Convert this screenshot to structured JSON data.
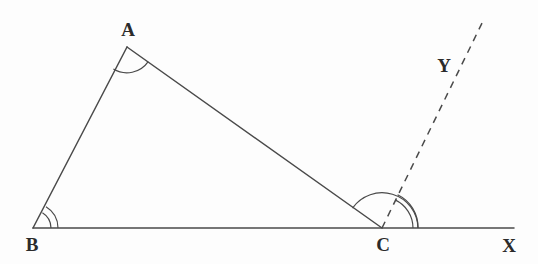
{
  "figure": {
    "background_color": "#fdfdfd",
    "stroke_color": "#4a4a4a",
    "label_color": "#2b2b2b",
    "width": 538,
    "height": 264
  },
  "points": {
    "A": {
      "label": "A",
      "x": 127,
      "y": 47,
      "label_x": 128,
      "label_y": 29
    },
    "B": {
      "label": "B",
      "x": 33,
      "y": 228,
      "label_x": 32,
      "label_y": 244
    },
    "C": {
      "label": "C",
      "x": 382,
      "y": 228,
      "label_x": 383,
      "label_y": 244
    },
    "X": {
      "label": "X",
      "x": 514,
      "y": 228,
      "label_x": 509,
      "label_y": 245
    },
    "Y": {
      "label": "Y",
      "x": 484,
      "y": 19,
      "label_x": 444,
      "label_y": 65
    }
  },
  "segments": [
    {
      "name": "side-AB",
      "from": "B",
      "to": "A",
      "style": "solid",
      "x1": 33,
      "y1": 228,
      "x2": 127,
      "y2": 47
    },
    {
      "name": "side-AC",
      "from": "A",
      "to": "C",
      "style": "solid",
      "x1": 127,
      "y1": 47,
      "x2": 382,
      "y2": 228
    },
    {
      "name": "line-BX",
      "from": "B",
      "to": "X",
      "style": "solid",
      "x1": 33,
      "y1": 228,
      "x2": 514,
      "y2": 228
    },
    {
      "name": "ray-CY",
      "from": "C",
      "to": "Y",
      "style": "dashed",
      "x1": 382,
      "y1": 228,
      "x2": 484,
      "y2": 19
    }
  ],
  "angle_marks": [
    {
      "name": "angle-mark-A",
      "vertex": "A",
      "arcs": 1,
      "radii": [
        26
      ]
    },
    {
      "name": "angle-mark-B",
      "vertex": "B",
      "arcs": 2,
      "radii": [
        18,
        25
      ]
    },
    {
      "name": "angle-mark-ACX",
      "vertex": "C",
      "arcs": 1,
      "radii": [
        36
      ]
    },
    {
      "name": "angle-mark-YCX",
      "vertex": "C",
      "arcs": 2,
      "radii": [
        31,
        36
      ]
    }
  ],
  "labels": {
    "A": "A",
    "B": "B",
    "C": "C",
    "X": "X",
    "Y": "Y"
  }
}
